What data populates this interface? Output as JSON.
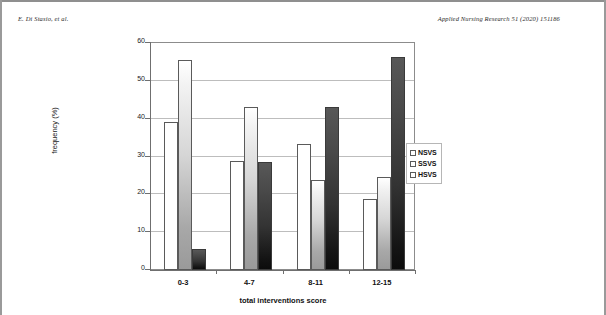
{
  "page": {
    "running_head_left": "E. Di Stasio, et al.",
    "running_head_right": "Applied Nursing Research 51 (2020) 151186"
  },
  "legend": {
    "items": [
      {
        "label": "NSVS",
        "swatch": "white-bar-swatch"
      },
      {
        "label": "SSVS",
        "swatch": "light-gradient-bar-swatch"
      },
      {
        "label": "HSVS",
        "swatch": "dark-gradient-bar-swatch"
      }
    ]
  },
  "chart_data": {
    "type": "bar",
    "title": "",
    "xlabel": "total interventions score",
    "ylabel": "frequency (%)",
    "categories": [
      "0-3",
      "4-7",
      "8-11",
      "12-15"
    ],
    "series": [
      {
        "name": "NSVS",
        "values": [
          39.0,
          28.7,
          33.3,
          18.7
        ]
      },
      {
        "name": "SSVS",
        "values": [
          55.5,
          43.0,
          23.7,
          24.7
        ]
      },
      {
        "name": "HSVS",
        "values": [
          5.5,
          28.6,
          43.0,
          56.3
        ]
      }
    ],
    "ylim": [
      0,
      60
    ],
    "yticks": [
      0,
      10,
      20,
      30,
      40,
      50,
      60
    ],
    "ytick_labels": [
      "0",
      "10",
      "20",
      "30",
      "40",
      "50",
      "60"
    ],
    "grid": true,
    "legend_position": "right"
  }
}
